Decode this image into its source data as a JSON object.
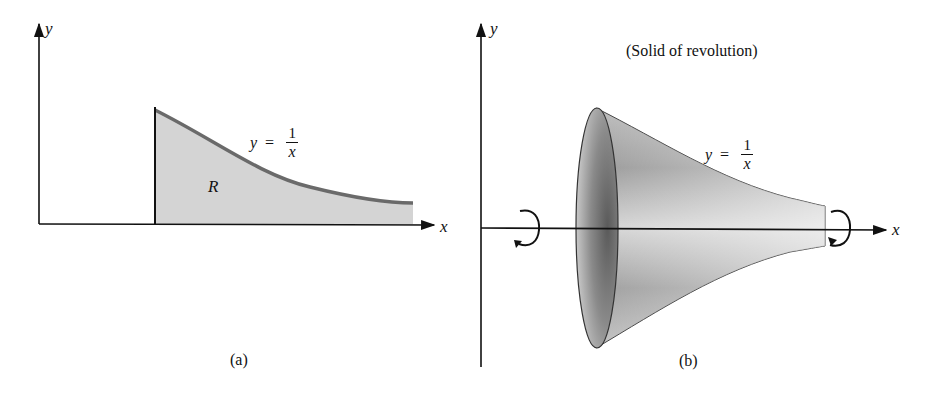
{
  "panel_a": {
    "caption": "(a)",
    "y_axis_label": "y",
    "x_axis_label": "x",
    "region_label": "R",
    "equation": {
      "lhs": "y",
      "eq": "=",
      "numerator": "1",
      "denominator": "x"
    },
    "fill_color": "#d4d4d4",
    "curve_color": "#6a6a6a"
  },
  "panel_b": {
    "caption": "(b)",
    "title": "(Solid of revolution)",
    "y_axis_label": "y",
    "x_axis_label": "x",
    "equation": {
      "lhs": "y",
      "eq": "=",
      "numerator": "1",
      "denominator": "x"
    },
    "solid_color": "#cfcfcf",
    "shade_color": "#7a7a7a"
  }
}
